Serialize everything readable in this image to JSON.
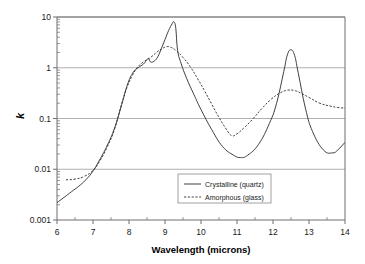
{
  "chart_data": {
    "type": "line",
    "title": "",
    "xlabel": "Wavelength (microns)",
    "ylabel": "k",
    "xlim": [
      6,
      14
    ],
    "ylim": [
      0.001,
      10
    ],
    "yscale": "log",
    "xscale": "linear",
    "grid": "horizontal-major",
    "xticks": [
      6,
      7,
      8,
      9,
      10,
      11,
      12,
      13,
      14
    ],
    "xticklabels": [
      "6",
      "7",
      "8",
      "9",
      "10",
      "11",
      "12",
      "13",
      "14"
    ],
    "yticks": [
      0.001,
      0.01,
      0.1,
      1,
      10
    ],
    "yticklabels": [
      "0.001",
      "0.01",
      "0.1",
      "1",
      "10"
    ],
    "legend_position": "lower-center-right",
    "series": [
      {
        "name": "Crystalline (quartz)",
        "style": "solid",
        "color": "#2b2b2b",
        "x": [
          6.0,
          6.2,
          6.4,
          6.6,
          6.8,
          7.0,
          7.2,
          7.4,
          7.6,
          7.8,
          7.95,
          8.1,
          8.25,
          8.4,
          8.5,
          8.55,
          8.6,
          8.7,
          8.8,
          8.9,
          9.0,
          9.1,
          9.2,
          9.25,
          9.3,
          9.35,
          9.45,
          9.6,
          9.8,
          10.0,
          10.3,
          10.6,
          10.9,
          11.1,
          11.3,
          11.6,
          11.9,
          12.1,
          12.3,
          12.4,
          12.5,
          12.6,
          12.7,
          12.9,
          13.1,
          13.4,
          13.65,
          13.8,
          14.0
        ],
        "y": [
          0.0022,
          0.0028,
          0.0036,
          0.0046,
          0.0062,
          0.0092,
          0.016,
          0.03,
          0.065,
          0.19,
          0.45,
          0.78,
          1.0,
          1.18,
          1.45,
          1.52,
          1.3,
          1.35,
          1.65,
          2.4,
          3.6,
          5.4,
          7.4,
          8.0,
          6.0,
          2.2,
          1.2,
          0.62,
          0.3,
          0.15,
          0.06,
          0.028,
          0.019,
          0.017,
          0.019,
          0.031,
          0.08,
          0.2,
          0.85,
          1.8,
          2.25,
          1.75,
          0.8,
          0.16,
          0.055,
          0.024,
          0.021,
          0.024,
          0.034
        ]
      },
      {
        "name": "Amorphous (glass)",
        "style": "dotted",
        "color": "#2b2b2b",
        "x": [
          6.25,
          6.5,
          6.75,
          7.0,
          7.2,
          7.4,
          7.6,
          7.8,
          7.95,
          8.1,
          8.25,
          8.4,
          8.6,
          8.8,
          8.95,
          9.05,
          9.15,
          9.3,
          9.5,
          9.7,
          9.9,
          10.1,
          10.3,
          10.5,
          10.7,
          10.85,
          11.0,
          11.2,
          11.45,
          11.7,
          11.95,
          12.2,
          12.4,
          12.6,
          12.8,
          13.0,
          13.3,
          13.6,
          13.8,
          14.0
        ],
        "y": [
          0.0062,
          0.0064,
          0.0072,
          0.0095,
          0.015,
          0.028,
          0.062,
          0.2,
          0.42,
          0.72,
          1.05,
          1.3,
          1.6,
          2.1,
          2.45,
          2.6,
          2.55,
          2.2,
          1.6,
          1.05,
          0.62,
          0.35,
          0.19,
          0.105,
          0.062,
          0.046,
          0.05,
          0.066,
          0.1,
          0.16,
          0.24,
          0.32,
          0.36,
          0.355,
          0.31,
          0.26,
          0.2,
          0.175,
          0.165,
          0.16
        ]
      }
    ]
  },
  "legend": {
    "items": [
      {
        "label": "Crystalline (quartz)",
        "style": "solid"
      },
      {
        "label": "Amorphous (glass)",
        "style": "dotted"
      }
    ]
  }
}
